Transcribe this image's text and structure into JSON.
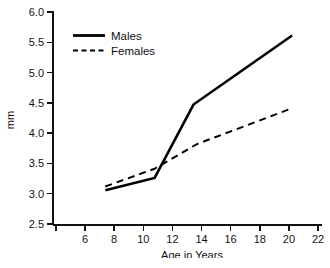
{
  "chart_data": {
    "type": "line",
    "title": "",
    "xlabel": "Age in Years",
    "ylabel": "mm",
    "xlim": [
      4,
      22
    ],
    "ylim": [
      2.5,
      6.0
    ],
    "grid": false,
    "legend_position": "upper-left",
    "xticks": [
      4,
      6,
      8,
      10,
      12,
      14,
      16,
      18,
      20,
      22
    ],
    "xtick_labels": [
      "",
      "6",
      "8",
      "10",
      "12",
      "14",
      "16",
      "18",
      "20",
      "22"
    ],
    "yticks": [
      2.5,
      3.0,
      3.5,
      4.0,
      4.5,
      5.0,
      5.5,
      6.0
    ],
    "ytick_labels": [
      "2.5",
      "3.0",
      "3.5",
      "4.0",
      "4.5",
      "5.0",
      "5.5",
      "6.0"
    ],
    "series": [
      {
        "name": "Males",
        "style": "solid",
        "color": "#000000",
        "x": [
          7.5,
          10.8,
          13.4,
          20.0
        ],
        "values": [
          3.07,
          3.27,
          4.47,
          5.6
        ]
      },
      {
        "name": "Females",
        "style": "dashed",
        "color": "#000000",
        "x": [
          7.5,
          10.8,
          13.6,
          20.0
        ],
        "values": [
          3.13,
          3.42,
          3.82,
          4.41
        ]
      }
    ]
  },
  "axes": {
    "x_title": "Age in Years",
    "y_title": "mm"
  },
  "legend": {
    "entries": [
      {
        "label": "Males"
      },
      {
        "label": "Females"
      }
    ]
  },
  "ytick_text": {
    "t0": "2.5",
    "t1": "3.0",
    "t2": "3.5",
    "t3": "4.0",
    "t4": "4.5",
    "t5": "5.0",
    "t6": "5.5",
    "t7": "6.0"
  },
  "xtick_text": {
    "t1": "6",
    "t2": "8",
    "t3": "10",
    "t4": "12",
    "t5": "14",
    "t6": "16",
    "t7": "18",
    "t8": "20",
    "t9": "22"
  }
}
